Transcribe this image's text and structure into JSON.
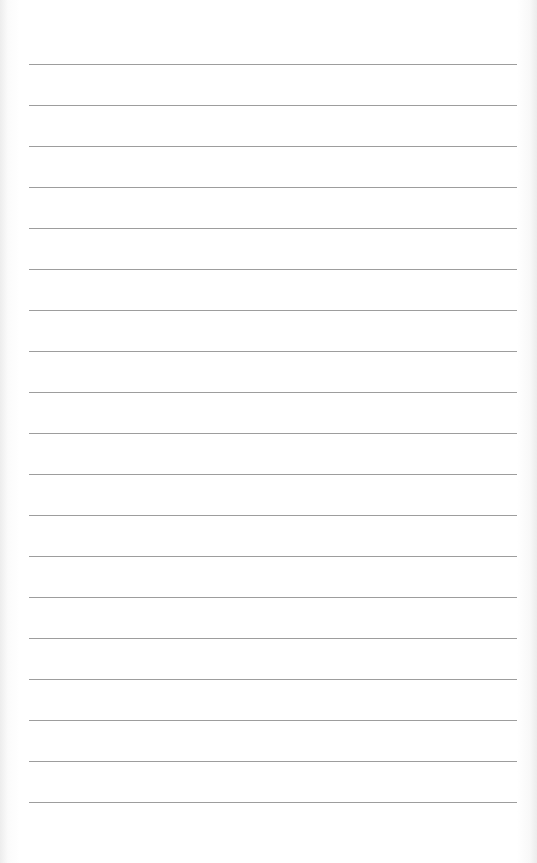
{
  "page": {
    "type": "lined-paper",
    "background_color": "#ffffff",
    "rule_color": "#8c8c8c",
    "rule_count": 19,
    "first_rule_y": 64,
    "rule_spacing_px": 41,
    "rule_left_x": 29,
    "rule_right_x": 517
  }
}
